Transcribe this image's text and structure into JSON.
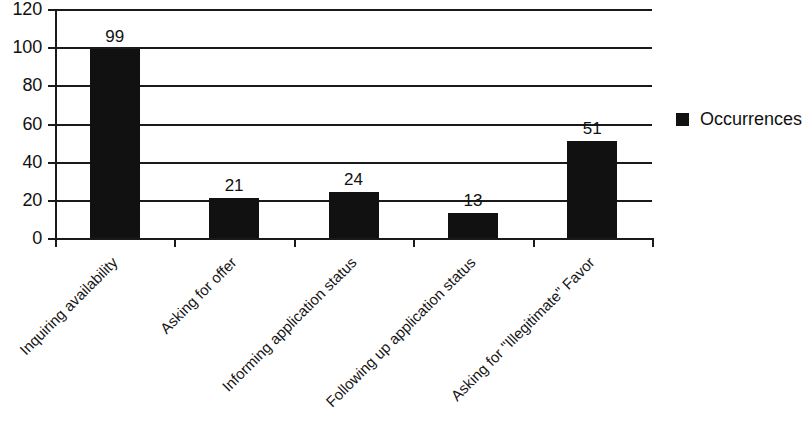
{
  "chart_data": {
    "type": "bar",
    "title": "",
    "xlabel": "",
    "ylabel": "",
    "categories": [
      "Inquiring availability",
      "Asking for offer",
      "Informing application status",
      "Following up application status",
      "Asking for \"Illegitimate\" Favor"
    ],
    "values": [
      99,
      21,
      24,
      13,
      51
    ],
    "series": [
      {
        "name": "Occurrences",
        "values": [
          99,
          21,
          24,
          13,
          51
        ],
        "color": "#111111"
      }
    ],
    "ylim": [
      0,
      120
    ],
    "y_ticks": [
      0,
      20,
      40,
      60,
      80,
      100,
      120
    ],
    "y_tick_labels": [
      "0",
      "20",
      "40",
      "60",
      "80",
      "100",
      "120"
    ],
    "grid": "horizontal",
    "legend_position": "right",
    "data_labels": [
      "99",
      "21",
      "24",
      "13",
      "51"
    ],
    "bar_color": "#111111",
    "axis_color": "#1a1a1a",
    "background_color": "#ffffff"
  },
  "legend": {
    "entries": [
      {
        "label": "Occurrences",
        "color": "#111111",
        "marker": "square"
      }
    ]
  }
}
